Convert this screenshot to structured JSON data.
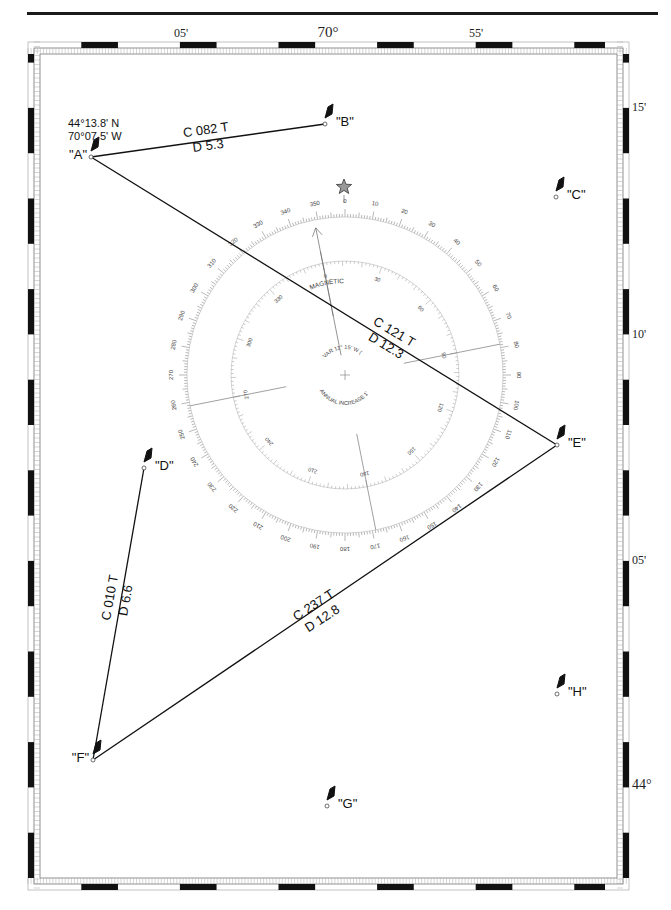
{
  "chart": {
    "frame": {
      "left": 40,
      "top": 54,
      "right": 617,
      "bottom": 878
    },
    "longitude_labels": [
      {
        "text": "05'",
        "x": 181
      },
      {
        "text": "70°",
        "x": 328,
        "large": true
      },
      {
        "text": "55'",
        "x": 476
      }
    ],
    "latitude_labels": [
      {
        "text": "15'",
        "y": 107
      },
      {
        "text": "10'",
        "y": 334
      },
      {
        "text": "05'",
        "y": 560
      },
      {
        "text": "44°",
        "y": 785
      }
    ],
    "position_note": {
      "lat": "44°13.8' N",
      "lon": "70°07.5' W"
    },
    "waypoints": [
      {
        "id": "A",
        "label": "\"A\"",
        "x": 91,
        "y": 157,
        "label_side": "left"
      },
      {
        "id": "B",
        "label": "\"B\"",
        "x": 325,
        "y": 124,
        "label_side": "right"
      },
      {
        "id": "C",
        "label": "\"C\"",
        "x": 556,
        "y": 197,
        "label_side": "right"
      },
      {
        "id": "D",
        "label": "\"D\"",
        "x": 144,
        "y": 468,
        "label_side": "right"
      },
      {
        "id": "E",
        "label": "\"E\"",
        "x": 557,
        "y": 445,
        "label_side": "right"
      },
      {
        "id": "F",
        "label": "\"F\"",
        "x": 93,
        "y": 760,
        "label_side": "left"
      },
      {
        "id": "G",
        "label": "\"G\"",
        "x": 327,
        "y": 806,
        "label_side": "right"
      },
      {
        "id": "H",
        "label": "\"H\"",
        "x": 557,
        "y": 694,
        "label_side": "right"
      }
    ],
    "legs": [
      {
        "from": "A",
        "to": "B",
        "course": "C 082 T",
        "distance": "D 5.3",
        "lx": 207,
        "ly": 138,
        "angle": -8
      },
      {
        "from": "A",
        "to": "E",
        "course": "C 121 T",
        "distance": "D 12.3",
        "lx": 390,
        "ly": 339,
        "angle": 31
      },
      {
        "from": "E",
        "to": "F",
        "course": "C 237 T",
        "distance": "D 12.8",
        "lx": 318,
        "ly": 612,
        "angle": -33
      },
      {
        "from": "F",
        "to": "D",
        "course": "C 010 T",
        "distance": "D 6.6",
        "lx": 118,
        "ly": 599,
        "angle": -80
      }
    ],
    "compass_rose": {
      "cx": 345,
      "cy": 375,
      "outer_radius": 158,
      "inner_radius": 114,
      "variation_deg": -11.25,
      "outer_labels": [
        "0",
        "10",
        "20",
        "30",
        "40",
        "50",
        "60",
        "70",
        "80",
        "90",
        "100",
        "110",
        "120",
        "130",
        "140",
        "150",
        "160",
        "170",
        "180",
        "190",
        "200",
        "210",
        "220",
        "230",
        "240",
        "250",
        "260",
        "270",
        "280",
        "290",
        "300",
        "310",
        "320",
        "330",
        "340",
        "350"
      ],
      "inner_labels": [
        "0",
        "30",
        "60",
        "90",
        "120",
        "150",
        "180",
        "210",
        "240",
        "270",
        "300",
        "330"
      ],
      "magnetic_label": "MAGNETIC",
      "variation_label": "VAR  11° 15' W (1978)",
      "annual_label": "ANNUAL INCREASE  1'"
    }
  }
}
